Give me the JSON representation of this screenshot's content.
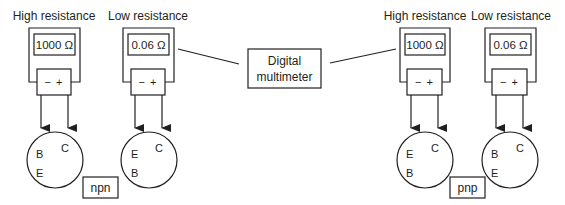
{
  "diagram": {
    "title_box": {
      "line1": "Digital",
      "line2": "multimeter"
    },
    "colors": {
      "stroke": "#231f20",
      "background": "#ffffff"
    },
    "meters": [
      {
        "label": "High resistance",
        "reading": "1000 Ω",
        "connector": "− +"
      },
      {
        "label": "Low resistance",
        "reading": "0.06 Ω",
        "connector": "− +"
      },
      {
        "label": "High resistance",
        "reading": "1000 Ω",
        "connector": "− +"
      },
      {
        "label": "Low resistance",
        "reading": "0.06 Ω",
        "connector": "− +"
      }
    ],
    "transistors": [
      {
        "pins": [
          "B",
          "E",
          "C"
        ]
      },
      {
        "pins": [
          "E",
          "B",
          "C"
        ]
      },
      {
        "pins": [
          "E",
          "B",
          "C"
        ]
      },
      {
        "pins": [
          "B",
          "E",
          "C"
        ]
      }
    ],
    "types": {
      "left": "npn",
      "right": "pnp"
    }
  }
}
